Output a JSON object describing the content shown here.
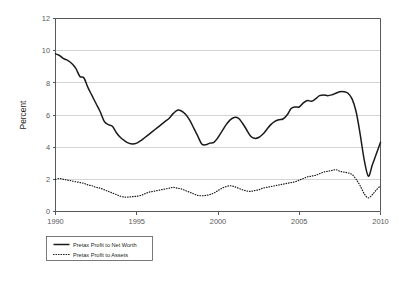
{
  "chart_data": {
    "type": "line",
    "title": "",
    "subtitle": "",
    "xlabel": "",
    "ylabel": "Percent",
    "xlim": [
      1990,
      2010
    ],
    "ylim": [
      0,
      12
    ],
    "grid": true,
    "grid_axis": "y",
    "legend_position": "bottom-left",
    "x_ticks": [
      "1990",
      "1995",
      "2000",
      "2005",
      "2010"
    ],
    "x_tick_values": [
      1990,
      1995,
      2000,
      2005,
      2010
    ],
    "y_ticks": [
      "0",
      "2",
      "4",
      "6",
      "8",
      "10",
      "12"
    ],
    "y_tick_values": [
      0,
      2,
      4,
      6,
      8,
      10,
      12
    ],
    "x": [
      1990.0,
      1990.25,
      1990.5,
      1990.75,
      1991.0,
      1991.25,
      1991.5,
      1991.75,
      1992.0,
      1992.25,
      1992.5,
      1992.75,
      1993.0,
      1993.25,
      1993.5,
      1993.75,
      1994.0,
      1994.25,
      1994.5,
      1994.75,
      1995.0,
      1995.25,
      1995.5,
      1995.75,
      1996.0,
      1996.25,
      1996.5,
      1996.75,
      1997.0,
      1997.25,
      1997.5,
      1997.75,
      1998.0,
      1998.25,
      1998.5,
      1998.75,
      1999.0,
      1999.25,
      1999.5,
      1999.75,
      2000.0,
      2000.25,
      2000.5,
      2000.75,
      2001.0,
      2001.25,
      2001.5,
      2001.75,
      2002.0,
      2002.25,
      2002.5,
      2002.75,
      2003.0,
      2003.25,
      2003.5,
      2003.75,
      2004.0,
      2004.25,
      2004.5,
      2004.75,
      2005.0,
      2005.25,
      2005.5,
      2005.75,
      2006.0,
      2006.25,
      2006.5,
      2006.75,
      2007.0,
      2007.25,
      2007.5,
      2007.75,
      2008.0,
      2008.25,
      2008.5,
      2008.75,
      2009.0,
      2009.25,
      2009.5,
      2009.75,
      2010.0
    ],
    "series": [
      {
        "name": "Pretax Profit to Net Worth",
        "style": "solid",
        "color": "#1a1a1a",
        "values": [
          9.8,
          9.7,
          9.5,
          9.4,
          9.2,
          8.9,
          8.4,
          8.3,
          7.7,
          7.2,
          6.7,
          6.2,
          5.6,
          5.4,
          5.3,
          4.9,
          4.6,
          4.4,
          4.25,
          4.2,
          4.25,
          4.4,
          4.6,
          4.8,
          5.0,
          5.2,
          5.4,
          5.6,
          5.8,
          6.1,
          6.3,
          6.25,
          6.05,
          5.7,
          5.2,
          4.7,
          4.2,
          4.15,
          4.25,
          4.3,
          4.6,
          5.0,
          5.4,
          5.7,
          5.85,
          5.8,
          5.5,
          5.1,
          4.7,
          4.55,
          4.6,
          4.8,
          5.1,
          5.4,
          5.6,
          5.7,
          5.75,
          6.0,
          6.4,
          6.5,
          6.5,
          6.75,
          6.9,
          6.85,
          7.0,
          7.2,
          7.25,
          7.2,
          7.25,
          7.35,
          7.45,
          7.45,
          7.35,
          7.0,
          6.2,
          4.8,
          3.2,
          2.2,
          2.9,
          3.6,
          4.3
        ]
      },
      {
        "name": "Pretax Profit to Assets",
        "style": "dotted",
        "color": "#1a1a1a",
        "values": [
          2.0,
          2.05,
          2.0,
          1.95,
          1.9,
          1.85,
          1.8,
          1.75,
          1.65,
          1.6,
          1.5,
          1.45,
          1.35,
          1.25,
          1.15,
          1.05,
          0.95,
          0.9,
          0.9,
          0.92,
          0.95,
          1.0,
          1.1,
          1.2,
          1.25,
          1.3,
          1.35,
          1.4,
          1.45,
          1.5,
          1.45,
          1.4,
          1.3,
          1.2,
          1.1,
          1.0,
          0.98,
          1.0,
          1.05,
          1.15,
          1.3,
          1.45,
          1.55,
          1.6,
          1.55,
          1.45,
          1.35,
          1.28,
          1.25,
          1.3,
          1.35,
          1.45,
          1.5,
          1.55,
          1.6,
          1.65,
          1.7,
          1.75,
          1.8,
          1.85,
          1.95,
          2.05,
          2.15,
          2.2,
          2.25,
          2.35,
          2.45,
          2.5,
          2.55,
          2.6,
          2.5,
          2.45,
          2.4,
          2.3,
          2.0,
          1.6,
          1.1,
          0.85,
          1.05,
          1.35,
          1.6
        ]
      }
    ],
    "legend": [
      {
        "label": "Pretax Profit to Net Worth",
        "style": "solid"
      },
      {
        "label": "Pretax Profit to Assets",
        "style": "dotted"
      }
    ]
  }
}
